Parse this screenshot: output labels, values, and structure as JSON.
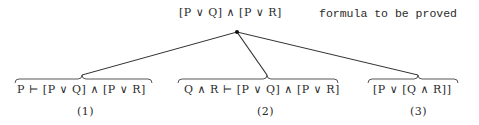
{
  "root": {
    "formula": "[P ∨ Q] ∧ [P ∨ R]",
    "caption": "formula to be proved"
  },
  "branches": [
    {
      "formula": "P ⊢ [P ∨ Q] ∧ [P ∨ R]",
      "label": "(1)"
    },
    {
      "formula": "Q ∧ R ⊢ [P ∨ Q] ∧ [P ∨ R]",
      "label": "(2)"
    },
    {
      "formula": "[P ∨ [Q ∧ R]]",
      "label": "(3)"
    }
  ],
  "colors": {
    "ink": "#2a2a2a",
    "background": "#ffffff"
  }
}
